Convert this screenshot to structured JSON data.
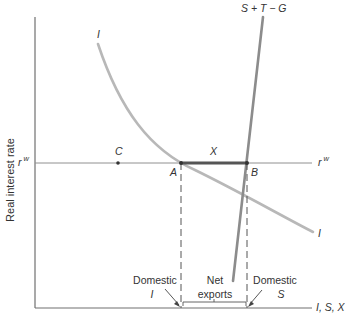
{
  "diagram": {
    "y_axis_label": "Real interest rate",
    "x_axis_label": "I, S, X",
    "world_rate": {
      "symbol": "r",
      "superscript": "w"
    },
    "curves": {
      "investment": {
        "label": "I",
        "color": "#b5b5b5"
      },
      "national_saving": {
        "label": "S + T − G",
        "color": "#8a8a8a"
      }
    },
    "points": {
      "A": "A",
      "B": "B",
      "C": "C"
    },
    "segment_label": "X",
    "annotations": {
      "domestic_investment": {
        "line1": "Domestic",
        "line2": "I"
      },
      "net_exports": {
        "line1": "Net",
        "line2": "exports"
      },
      "domestic_saving": {
        "line1": "Domestic",
        "line2": "S"
      }
    },
    "colors": {
      "axis": "#707070",
      "investment": "#b5b5b5",
      "saving": "#8a8a8a",
      "segment": "#555555"
    }
  }
}
